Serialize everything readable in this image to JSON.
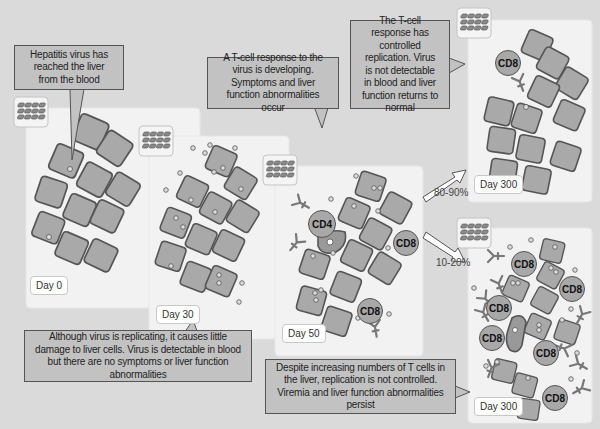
{
  "colors": {
    "background": "#dadada",
    "panel": "#f2f2f2",
    "hepatocyte_fill": "#a9a9a9",
    "hepatocyte_stroke": "#555555",
    "callout_fill": "#c2c2c2",
    "tcell_fill": "#a8a8a8"
  },
  "panels": [
    {
      "id": "day0",
      "label": "Day 0"
    },
    {
      "id": "day30",
      "label": "Day 30"
    },
    {
      "id": "day50",
      "label": "Day 50"
    },
    {
      "id": "day300_resolved",
      "label": "Day 300"
    },
    {
      "id": "day300_chronic",
      "label": "Day 300"
    }
  ],
  "callouts": {
    "day0": "Hepatitis virus has reached the liver from the blood",
    "day30": "Although virus is replicating, it causes little damage to liver cells. Virus is detectable in blood but there are no symptoms or liver function abnormalities",
    "day50": "A T-cell response to the virus is developing. Symptoms and liver function abnormalities occur",
    "resolved": "The T-cell response has controlled replication. Virus is not detectable in blood and liver function returns to normal",
    "chronic": "Despite increasing numbers of T cells in the liver, replication is not controlled. Viremia and liver function abnormalities persist"
  },
  "outcomes": [
    {
      "label": "80-90%",
      "target": "day300_resolved"
    },
    {
      "label": "10-20%",
      "target": "day300_chronic"
    }
  ],
  "tcells": {
    "cd4": "CD4",
    "cd8": "CD8"
  },
  "icons": [
    "blood-vessel-icon",
    "hepatocyte-icon",
    "virus-particle-icon",
    "antibody-icon",
    "t-cell-icon",
    "arrow-icon"
  ]
}
